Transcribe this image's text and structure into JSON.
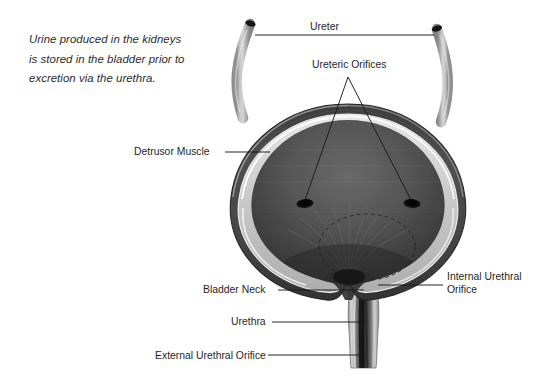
{
  "caption": {
    "line1": "Urine produced in the kidneys",
    "line2": "is stored in the bladder prior to",
    "line3": "excretion via the urethra."
  },
  "labels": {
    "ureter": "Ureter",
    "ureteric_orifices": "Ureteric Orifices",
    "detrusor_muscle": "Detrusor Muscle",
    "bladder_neck": "Bladder Neck",
    "urethra": "Urethra",
    "external_urethral_orifice": "External Urethral Orifice",
    "internal_urethral_orifice_line1": "Internal Urethral",
    "internal_urethral_orifice_line2": "Orifice"
  },
  "colors": {
    "background": "#ffffff",
    "text": "#1f1f1f",
    "caption_text": "#2b2b2b",
    "leader_line": "#1a1a1a",
    "wall_dark": "#4a4a4a",
    "wall_outline": "#2e2e2e",
    "wall_highlight": "#f2f2f2",
    "mucosa_light": "#c9c9c9",
    "cavity_dark": "#3a3a3a",
    "cavity_mid": "#555555",
    "orifice_dot": "#101010",
    "ureter_tube": "#b5b5b5",
    "ureter_lumen": "#141414",
    "trigone_dash": "#2a2a2a"
  },
  "diagram": {
    "parts": [
      "left-ureter",
      "right-ureter",
      "bladder-dome",
      "detrusor-muscle-wall",
      "bladder-cavity",
      "left-ureteric-orifice",
      "right-ureteric-orifice",
      "trigone-dashed-circle",
      "bladder-neck",
      "urethra",
      "external-urethral-orifice"
    ]
  }
}
